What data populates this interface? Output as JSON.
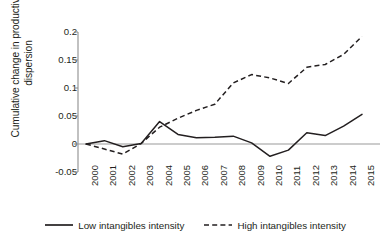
{
  "chart_data": {
    "type": "line",
    "title": "",
    "xlabel": "",
    "ylabel": "Cumulative change in productivity dispersion",
    "ylabel_line1": "Cumulative change in productivity",
    "ylabel_line2": "dispersion",
    "categories": [
      "2000",
      "2001",
      "2002",
      "2003",
      "2004",
      "2005",
      "2006",
      "2007",
      "2008",
      "2009",
      "2010",
      "2011",
      "2012",
      "2013",
      "2014",
      "2015"
    ],
    "x": [
      2000,
      2001,
      2002,
      2003,
      2004,
      2005,
      2006,
      2007,
      2008,
      2009,
      2010,
      2011,
      2012,
      2013,
      2014,
      2015
    ],
    "ylim": [
      -0.05,
      0.2
    ],
    "yticks": [
      -0.05,
      0,
      0.05,
      0.1,
      0.15,
      0.2
    ],
    "ytick_labels": [
      "-0.05",
      "0",
      "0.05",
      "0.1",
      "0.15",
      "0.2"
    ],
    "grid": false,
    "zero_line": true,
    "legend_position": "bottom",
    "series": [
      {
        "name": "Low intangibles intensity",
        "style": "solid",
        "color": "#231f20",
        "values": [
          0.0,
          0.006,
          -0.005,
          0.001,
          0.04,
          0.017,
          0.011,
          0.012,
          0.014,
          0.002,
          -0.022,
          -0.011,
          0.02,
          0.015,
          0.032,
          0.053
        ]
      },
      {
        "name": "High intangibles intensity",
        "style": "dashed",
        "color": "#231f20",
        "values": [
          0.0,
          -0.009,
          -0.018,
          0.001,
          0.03,
          0.046,
          0.06,
          0.071,
          0.109,
          0.124,
          0.118,
          0.108,
          0.137,
          0.142,
          0.16,
          0.192
        ]
      }
    ]
  },
  "legend": {
    "items": [
      {
        "label": "Low intangibles intensity",
        "style": "solid"
      },
      {
        "label": "High intangibles intensity",
        "style": "dashed"
      }
    ]
  },
  "colors": {
    "line": "#231f20",
    "axis": "#8e8e8e",
    "zero_line": "#9a9a9a",
    "text": "#231f20",
    "background": "#ffffff"
  }
}
